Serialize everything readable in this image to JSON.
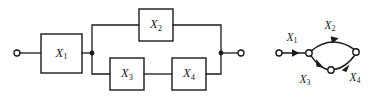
{
  "figure": {
    "background_color": "#ffffff",
    "line_color": "#1a1a1a",
    "width": 379,
    "height": 100
  },
  "block_diagram": {
    "name": "reliability-block-diagram",
    "input_terminal_label": "",
    "output_terminal_label": "",
    "blocks": [
      {
        "id": "x1",
        "label": "X",
        "subscript": "1",
        "x": 41,
        "y": 34,
        "w": 41,
        "h": 39
      },
      {
        "id": "x2",
        "label": "X",
        "subscript": "2",
        "x": 139,
        "y": 9,
        "w": 34,
        "h": 32
      },
      {
        "id": "x3",
        "label": "X",
        "subscript": "3",
        "x": 110,
        "y": 58,
        "w": 34,
        "h": 32
      },
      {
        "id": "x4",
        "label": "X",
        "subscript": "4",
        "x": 172,
        "y": 58,
        "w": 34,
        "h": 32
      }
    ],
    "junctions": [
      {
        "id": "split",
        "x": 92,
        "y": 53
      },
      {
        "id": "merge",
        "x": 221,
        "y": 53
      }
    ],
    "terminals": [
      {
        "id": "input",
        "x": 17,
        "y": 53,
        "r": 3
      },
      {
        "id": "output",
        "x": 241,
        "y": 53,
        "r": 3
      }
    ]
  },
  "graph_diagram": {
    "name": "directed-graph",
    "nodes": [
      {
        "id": "n_start",
        "x": 279,
        "y": 53,
        "r": 3
      },
      {
        "id": "n_a",
        "x": 309,
        "y": 53,
        "r": 3.2
      },
      {
        "id": "n_mid",
        "x": 331,
        "y": 70,
        "r": 3.2
      },
      {
        "id": "n_b",
        "x": 356,
        "y": 52,
        "r": 3.2
      }
    ],
    "edges": [
      {
        "id": "e1",
        "label": "X",
        "subscript": "1",
        "label_x": 292,
        "label_y": 38
      },
      {
        "id": "e2",
        "label": "X",
        "subscript": "2",
        "label_x": 330,
        "label_y": 27
      },
      {
        "id": "e3",
        "label": "X",
        "subscript": "3",
        "label_x": 305,
        "label_y": 80
      },
      {
        "id": "e4",
        "label": "X",
        "subscript": "4",
        "label_x": 355,
        "label_y": 78
      }
    ]
  }
}
